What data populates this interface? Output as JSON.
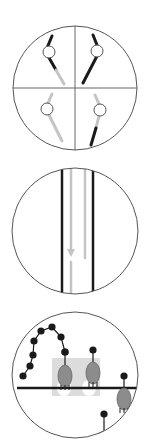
{
  "figure": {
    "width": 145,
    "height": 441,
    "background": "#ffffff",
    "colors": {
      "outline": "#555555",
      "black": "#1a1a1a",
      "gray": "#c4c4c4",
      "cell_fill": "#8c8c8c",
      "shade": "#dcdcdc",
      "ring_fill": "#ffffff"
    }
  },
  "panels": [
    {
      "id": "panel-quadrants",
      "circle": {
        "cx": 75,
        "cy": 88,
        "r": 62
      },
      "axes": [
        {
          "x1": 75,
          "y1": 26,
          "x2": 75,
          "y2": 150
        },
        {
          "x1": 13,
          "y1": 88,
          "x2": 137,
          "y2": 88
        }
      ],
      "strokes": [
        {
          "x1": 52,
          "y1": 36,
          "x2": 47,
          "y2": 48,
          "color": "black",
          "w": 3
        },
        {
          "x1": 48,
          "y1": 56,
          "x2": 56,
          "y2": 70,
          "color": "black",
          "w": 3
        },
        {
          "x1": 56,
          "y1": 70,
          "x2": 64,
          "y2": 84,
          "color": "gray",
          "w": 3
        },
        {
          "x1": 93,
          "y1": 35,
          "x2": 97,
          "y2": 45,
          "color": "black",
          "w": 3
        },
        {
          "x1": 97,
          "y1": 56,
          "x2": 83,
          "y2": 83,
          "color": "black",
          "w": 3
        },
        {
          "x1": 52,
          "y1": 94,
          "x2": 48,
          "y2": 103,
          "color": "gray",
          "w": 3
        },
        {
          "x1": 49,
          "y1": 115,
          "x2": 62,
          "y2": 141,
          "color": "gray",
          "w": 3
        },
        {
          "x1": 95,
          "y1": 95,
          "x2": 99,
          "y2": 104,
          "color": "gray",
          "w": 3
        },
        {
          "x1": 99,
          "y1": 116,
          "x2": 96,
          "y2": 128,
          "color": "gray",
          "w": 3
        },
        {
          "x1": 96,
          "y1": 128,
          "x2": 91,
          "y2": 145,
          "color": "black",
          "w": 3
        }
      ],
      "rings": [
        {
          "cx": 49,
          "cy": 52,
          "r": 6
        },
        {
          "cx": 97,
          "cy": 51,
          "r": 6
        },
        {
          "cx": 47,
          "cy": 109,
          "r": 6
        },
        {
          "cx": 100,
          "cy": 110,
          "r": 6
        }
      ]
    },
    {
      "id": "panel-channel",
      "circle": {
        "cx": 75,
        "cy": 231,
        "r": 63
      },
      "strokes": [
        {
          "x1": 62,
          "y1": 170,
          "x2": 62,
          "y2": 294,
          "color": "black",
          "w": 2.5
        },
        {
          "x1": 93,
          "y1": 170,
          "x2": 93,
          "y2": 294,
          "color": "black",
          "w": 2.5
        },
        {
          "x1": 71,
          "y1": 169,
          "x2": 71,
          "y2": 253,
          "color": "gray",
          "w": 2.5
        },
        {
          "x1": 71,
          "y1": 262,
          "x2": 71,
          "y2": 292,
          "color": "gray",
          "w": 2.5
        },
        {
          "x1": 85,
          "y1": 169,
          "x2": 85,
          "y2": 258,
          "color": "gray",
          "w": 2.5
        }
      ],
      "arrowheads": [
        {
          "points": "67,249 75,249 71,257",
          "color": "gray"
        }
      ]
    },
    {
      "id": "panel-surface",
      "circle": {
        "cx": 75,
        "cy": 375,
        "r": 63
      },
      "shade": {
        "x": 52,
        "y": 358,
        "w": 48,
        "h": 38
      },
      "shade_holes": [
        {
          "cx": 64,
          "cy": 388,
          "rx": 7,
          "ry": 8
        },
        {
          "cx": 89,
          "cy": 388,
          "rx": 7,
          "ry": 8
        }
      ],
      "surface": {
        "x1": 17,
        "y1": 388,
        "x2": 137,
        "y2": 388,
        "w": 2.5
      },
      "chain": [
        {
          "x": 23,
          "y": 376
        },
        {
          "x": 30,
          "y": 366
        },
        {
          "x": 33,
          "y": 355
        },
        {
          "x": 34,
          "y": 341
        },
        {
          "x": 41,
          "y": 331
        },
        {
          "x": 52,
          "y": 327
        },
        {
          "x": 61,
          "y": 337
        },
        {
          "x": 65,
          "y": 352
        }
      ],
      "chain_dot_r": 3.6,
      "cells": [
        {
          "cx": 65,
          "cy": 376,
          "rx": 7,
          "ry": 11,
          "stalk_top": 352,
          "legs_dir": "down"
        },
        {
          "cx": 93,
          "cy": 373,
          "rx": 7,
          "ry": 11,
          "stalk_top": 350,
          "legs_dir": "down"
        },
        {
          "cx": 124,
          "cy": 399,
          "rx": 7,
          "ry": 11,
          "stalk_top": 376,
          "legs_dir": "down"
        }
      ],
      "half_cell": {
        "cx": 104,
        "cy": 436,
        "rx": 7,
        "ry": 5,
        "stalk_top": 414
      }
    }
  ]
}
